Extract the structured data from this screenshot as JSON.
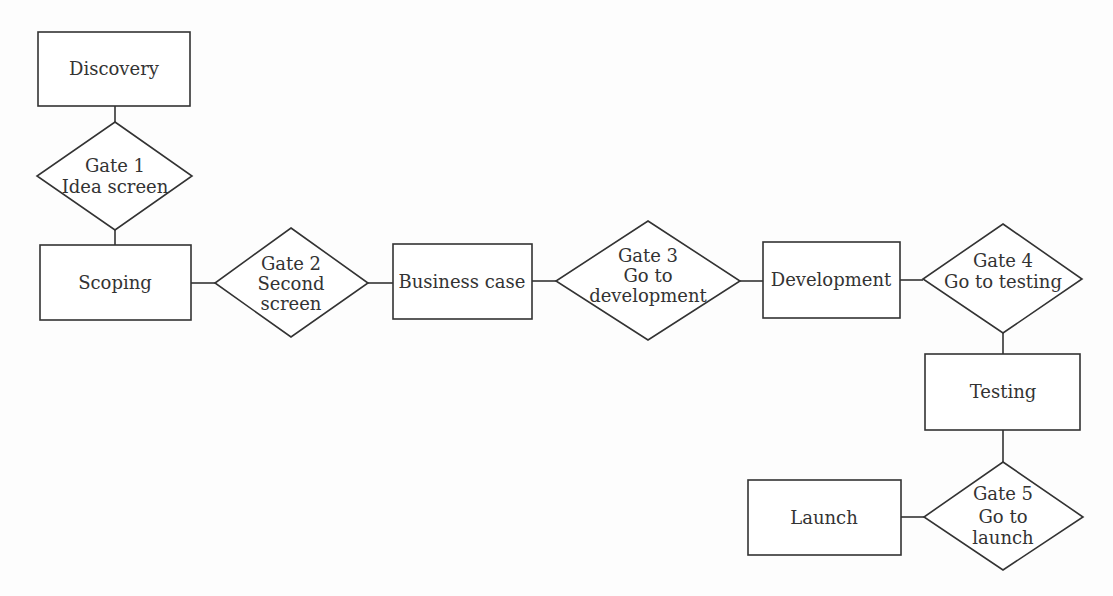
{
  "diagram": {
    "colors": {
      "stroke": "#333333",
      "fill": "#ffffff",
      "text": "#333333",
      "background": "#fdfdfd"
    },
    "nodes": [
      {
        "id": "discovery",
        "type": "stage",
        "lines": [
          "Discovery"
        ]
      },
      {
        "id": "gate1",
        "type": "gate",
        "lines": [
          "Gate 1",
          "Idea screen"
        ]
      },
      {
        "id": "scoping",
        "type": "stage",
        "lines": [
          "Scoping"
        ]
      },
      {
        "id": "gate2",
        "type": "gate",
        "lines": [
          "Gate 2",
          "Second",
          "screen"
        ]
      },
      {
        "id": "business_case",
        "type": "stage",
        "lines": [
          "Business case"
        ]
      },
      {
        "id": "gate3",
        "type": "gate",
        "lines": [
          "Gate 3",
          "Go to",
          "development"
        ]
      },
      {
        "id": "development",
        "type": "stage",
        "lines": [
          "Development"
        ]
      },
      {
        "id": "gate4",
        "type": "gate",
        "lines": [
          "Gate 4",
          "Go to testing"
        ]
      },
      {
        "id": "testing",
        "type": "stage",
        "lines": [
          "Testing"
        ]
      },
      {
        "id": "gate5",
        "type": "gate",
        "lines": [
          "Gate 5",
          "Go to",
          "launch"
        ]
      },
      {
        "id": "launch",
        "type": "stage",
        "lines": [
          "Launch"
        ]
      }
    ],
    "edges": [
      [
        "discovery",
        "gate1"
      ],
      [
        "gate1",
        "scoping"
      ],
      [
        "scoping",
        "gate2"
      ],
      [
        "gate2",
        "business_case"
      ],
      [
        "business_case",
        "gate3"
      ],
      [
        "gate3",
        "development"
      ],
      [
        "development",
        "gate4"
      ],
      [
        "gate4",
        "testing"
      ],
      [
        "testing",
        "gate5"
      ],
      [
        "gate5",
        "launch"
      ]
    ]
  }
}
